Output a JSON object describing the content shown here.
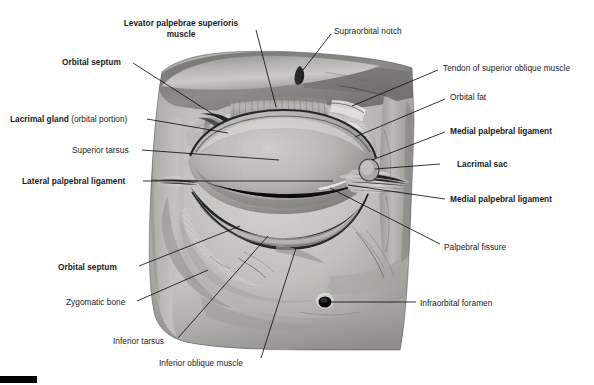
{
  "figure": {
    "type": "anatomical-photograph",
    "width": 594,
    "height": 385,
    "background_color": "#ffffff",
    "image_style": "grayscale halftone photograph of a cadaveric dissection",
    "corner_bar_color": "#000000"
  },
  "labels": [
    {
      "id": "levator-palpebrae-superioris-muscle",
      "text": "Levator palpebrae superioris",
      "text_line2": "muscle",
      "bold": true,
      "x": 108,
      "y": 18,
      "width": 146,
      "align": "center",
      "leader": {
        "x1": 256,
        "y1": 30,
        "x2": 276,
        "y2": 107
      }
    },
    {
      "id": "supraorbital-notch",
      "text": "Supraorbital notch",
      "bold": false,
      "x": 334,
      "y": 26,
      "align": "left",
      "leader": {
        "x1": 331,
        "y1": 34,
        "x2": 303,
        "y2": 70
      }
    },
    {
      "id": "orbital-septum-superior",
      "text": "Orbital septum",
      "bold": true,
      "x": 62,
      "y": 57,
      "align": "left",
      "leader": {
        "x1": 133,
        "y1": 63,
        "x2": 219,
        "y2": 118
      }
    },
    {
      "id": "tendon-of-superior-oblique-muscle",
      "text": "Tendon of superior oblique muscle",
      "bold": false,
      "x": 443,
      "y": 63,
      "align": "left",
      "leader": {
        "x1": 438,
        "y1": 70,
        "x2": 352,
        "y2": 106
      }
    },
    {
      "id": "orbital-fat",
      "text": "Orbital fat",
      "bold": false,
      "x": 450,
      "y": 92,
      "align": "left",
      "leader": {
        "x1": 445,
        "y1": 99,
        "x2": 355,
        "y2": 137
      }
    },
    {
      "id": "lacrimal-gland-orbital-portion",
      "text": "Lacrimal gland",
      "text_suffix": " (orbital portion)",
      "bold": true,
      "x": 10,
      "y": 114,
      "align": "left",
      "leader": {
        "x1": 147,
        "y1": 119,
        "x2": 228,
        "y2": 133
      }
    },
    {
      "id": "medial-palpebral-ligament-upper",
      "text": "Medial palpebral ligament",
      "bold": true,
      "x": 450,
      "y": 126,
      "align": "left",
      "leader": {
        "x1": 445,
        "y1": 132,
        "x2": 372,
        "y2": 160
      }
    },
    {
      "id": "superior-tarsus",
      "text": "Superior tarsus",
      "bold": false,
      "x": 72,
      "y": 145,
      "align": "left",
      "leader": {
        "x1": 142,
        "y1": 150,
        "x2": 279,
        "y2": 160
      }
    },
    {
      "id": "lacrimal-sac",
      "text": "Lacrimal sac",
      "bold": true,
      "x": 457,
      "y": 159,
      "align": "left",
      "leader": {
        "x1": 440,
        "y1": 164,
        "x2": 375,
        "y2": 169
      }
    },
    {
      "id": "lateral-palpebral-ligament",
      "text": "Lateral palpebral ligament",
      "bold": true,
      "x": 22,
      "y": 176,
      "align": "left",
      "leader": {
        "x1": 143,
        "y1": 181,
        "x2": 333,
        "y2": 181
      }
    },
    {
      "id": "medial-palpebral-ligament-lower",
      "text": "Medial palpebral ligament",
      "bold": true,
      "x": 450,
      "y": 194,
      "align": "left",
      "leader": {
        "x1": 445,
        "y1": 199,
        "x2": 348,
        "y2": 185
      }
    },
    {
      "id": "palpebral-fissure",
      "text": "Palpebral fissure",
      "bold": false,
      "x": 444,
      "y": 242,
      "align": "left",
      "leader": {
        "x1": 440,
        "y1": 244,
        "x2": 330,
        "y2": 188
      }
    },
    {
      "id": "orbital-septum-inferior",
      "text": "Orbital septum",
      "bold": true,
      "x": 58,
      "y": 262,
      "align": "left",
      "leader": {
        "x1": 139,
        "y1": 266,
        "x2": 240,
        "y2": 226
      }
    },
    {
      "id": "zygomatic-bone",
      "text": "Zygomatic bone",
      "bold": false,
      "x": 66,
      "y": 297,
      "align": "left",
      "leader": {
        "x1": 137,
        "y1": 301,
        "x2": 208,
        "y2": 270
      }
    },
    {
      "id": "infraorbital-foramen",
      "text": "Infraorbital foramen",
      "bold": false,
      "x": 420,
      "y": 298,
      "align": "left",
      "leader": {
        "x1": 416,
        "y1": 302,
        "x2": 331,
        "y2": 302
      }
    },
    {
      "id": "inferior-tarsus",
      "text": "Inferior tarsus",
      "bold": false,
      "x": 113,
      "y": 336,
      "align": "left",
      "leader": {
        "x1": 178,
        "y1": 338,
        "x2": 268,
        "y2": 236
      }
    },
    {
      "id": "inferior-oblique-muscle",
      "text": "Inferior oblique muscle",
      "bold": false,
      "x": 159,
      "y": 358,
      "align": "left",
      "leader": {
        "x1": 261,
        "y1": 358,
        "x2": 296,
        "y2": 248
      }
    }
  ],
  "structures": [
    {
      "id": "globe",
      "name": "eyeball / globe"
    },
    {
      "id": "upper-eyelid",
      "name": "upper eyelid"
    },
    {
      "id": "lower-eyelid",
      "name": "lower eyelid"
    },
    {
      "id": "levator-muscle-band",
      "name": "levator palpebrae superioris muscle band"
    },
    {
      "id": "orbital-fat-pad",
      "name": "orbital fat pad"
    },
    {
      "id": "lacrimal-gland-body",
      "name": "lacrimal gland"
    },
    {
      "id": "lacrimal-sac-body",
      "name": "lacrimal sac"
    },
    {
      "id": "supraorbital-notch-mark",
      "name": "supraorbital notch"
    },
    {
      "id": "infraorbital-foramen-hole",
      "name": "infraorbital foramen"
    },
    {
      "id": "palpebral-fissure-slit",
      "name": "palpebral fissure"
    },
    {
      "id": "zygomatic-bone-area",
      "name": "zygomatic bone"
    }
  ]
}
